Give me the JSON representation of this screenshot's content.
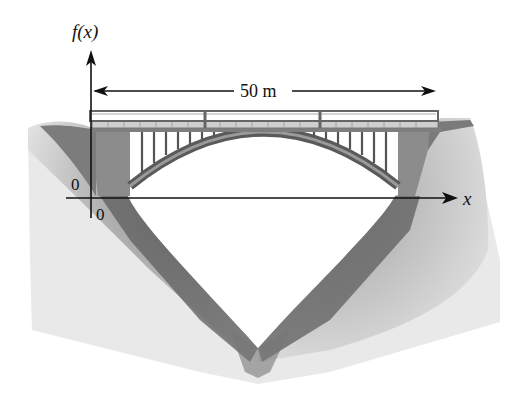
{
  "figure": {
    "y_axis_label": "f(x)",
    "x_axis_label": "x",
    "origin_y_label": "0",
    "origin_x_label": "0",
    "span_label": "50 m",
    "colors": {
      "ink": "#111111",
      "rock_dark": "#555555",
      "rock_light": "#e6e6e6",
      "abutment": "#8a8a8a",
      "deck": "#9a9a9a",
      "railing_fill": "#cfcfcf",
      "arch": "#6a6a6a",
      "background": "#ffffff"
    }
  }
}
